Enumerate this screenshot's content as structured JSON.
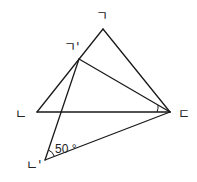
{
  "diagram": {
    "colors": {
      "stroke": "#1a1a1a",
      "background": "#ffffff"
    },
    "vertices": {
      "A": {
        "label": "ㄱ",
        "x": 103,
        "y": 29
      },
      "B": {
        "label": "ㄴ",
        "x": 37,
        "y": 112
      },
      "C": {
        "label": "ㄷ",
        "x": 170,
        "y": 112
      },
      "A_prime": {
        "label": "ㄱ'",
        "x": 79,
        "y": 59
      },
      "B_prime": {
        "label": "ㄴ'",
        "x": 45,
        "y": 160
      }
    },
    "segments": [
      [
        "ㄱ",
        "ㄴ"
      ],
      [
        "ㄱ",
        "ㄷ"
      ],
      [
        "ㄴ",
        "ㄷ"
      ],
      [
        "ㄱ'",
        "ㄴ'"
      ],
      [
        "ㄱ'",
        "ㄷ"
      ],
      [
        "ㄴ'",
        "ㄷ"
      ]
    ],
    "angle_marks": [
      {
        "at": "ㄴ'",
        "value": "50 °"
      },
      {
        "at": "ㄷ",
        "value": ""
      }
    ]
  }
}
